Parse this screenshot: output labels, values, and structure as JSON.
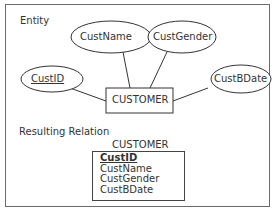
{
  "entity_section": {
    "label": "Entity",
    "entity": {
      "name": "CUSTOMER"
    },
    "attributes": [
      {
        "name": "CustID",
        "key": true
      },
      {
        "name": "CustName",
        "key": false
      },
      {
        "name": "CustGender",
        "key": false
      },
      {
        "name": "CustBDate",
        "key": false
      }
    ]
  },
  "relation_section": {
    "label": "Resulting Relation",
    "relation_name": "CUSTOMER",
    "fields": [
      {
        "name": "CustID",
        "primary_key": true
      },
      {
        "name": "CustName",
        "primary_key": false
      },
      {
        "name": "CustGender",
        "primary_key": false
      },
      {
        "name": "CustBDate",
        "primary_key": false
      }
    ]
  }
}
